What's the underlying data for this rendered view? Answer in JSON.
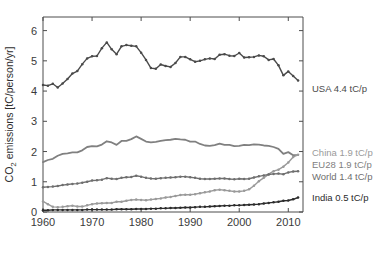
{
  "chart_data": {
    "type": "line",
    "title": "",
    "xlabel": "",
    "ylabel": "CO_2 emissions [tC/person/yr]",
    "ylabel_main": "CO",
    "ylabel_sub": "2",
    "ylabel_rest": " emissions [tC/person/yr]",
    "xlim": [
      1960,
      2013
    ],
    "ylim": [
      0,
      6.45
    ],
    "grid": false,
    "legend_position": "right-outside",
    "xticks": [
      1960,
      1970,
      1980,
      1990,
      2000,
      2010
    ],
    "xticklabels": [
      "1960",
      "1970",
      "1980",
      "1990",
      "2000",
      "2010"
    ],
    "yticks": [
      0,
      1,
      2,
      3,
      4,
      5,
      6
    ],
    "yticklabels": [
      "0",
      "1",
      "2",
      "3",
      "4",
      "5",
      "6"
    ],
    "x": [
      1960,
      1961,
      1962,
      1963,
      1964,
      1965,
      1966,
      1967,
      1968,
      1969,
      1970,
      1971,
      1972,
      1973,
      1974,
      1975,
      1976,
      1977,
      1978,
      1979,
      1980,
      1981,
      1982,
      1983,
      1984,
      1985,
      1986,
      1987,
      1988,
      1989,
      1990,
      1991,
      1992,
      1993,
      1994,
      1995,
      1996,
      1997,
      1998,
      1999,
      2000,
      2001,
      2002,
      2003,
      2004,
      2005,
      2006,
      2007,
      2008,
      2009,
      2010,
      2011,
      2012
    ],
    "series": [
      {
        "name": "USA",
        "label": "USA 4.4 tC/p",
        "color": "#4a4a4a",
        "end_value": 4.4,
        "marker": "dot",
        "values": [
          4.2,
          4.18,
          4.24,
          4.12,
          4.25,
          4.4,
          4.58,
          4.66,
          4.89,
          5.08,
          5.15,
          5.16,
          5.42,
          5.61,
          5.38,
          5.22,
          5.48,
          5.52,
          5.5,
          5.48,
          5.27,
          5.03,
          4.76,
          4.74,
          4.88,
          4.83,
          4.8,
          4.93,
          5.13,
          5.13,
          5.05,
          4.97,
          5.0,
          5.05,
          5.08,
          5.06,
          5.2,
          5.22,
          5.17,
          5.16,
          5.26,
          5.11,
          5.12,
          5.13,
          5.18,
          5.15,
          5.03,
          5.06,
          4.85,
          4.52,
          4.65,
          4.5,
          4.35
        ]
      },
      {
        "name": "EU28",
        "label": "EU28 1.9 tC/p",
        "color": "#808080",
        "end_value": 1.9,
        "marker": "line",
        "values": [
          1.65,
          1.72,
          1.76,
          1.86,
          1.92,
          1.94,
          1.97,
          1.97,
          2.04,
          2.15,
          2.18,
          2.17,
          2.23,
          2.34,
          2.3,
          2.22,
          2.35,
          2.35,
          2.41,
          2.5,
          2.42,
          2.33,
          2.3,
          2.32,
          2.35,
          2.38,
          2.39,
          2.42,
          2.4,
          2.39,
          2.33,
          2.33,
          2.25,
          2.2,
          2.19,
          2.21,
          2.26,
          2.22,
          2.22,
          2.18,
          2.19,
          2.22,
          2.21,
          2.24,
          2.23,
          2.2,
          2.19,
          2.15,
          2.09,
          1.92,
          1.98,
          1.88,
          1.88
        ]
      },
      {
        "name": "China",
        "label": "China 1.9 tC/p",
        "color": "#9a9a9a",
        "end_value": 1.9,
        "marker": "dot",
        "values": [
          0.35,
          0.26,
          0.17,
          0.16,
          0.17,
          0.19,
          0.21,
          0.18,
          0.18,
          0.22,
          0.26,
          0.28,
          0.29,
          0.3,
          0.3,
          0.34,
          0.34,
          0.37,
          0.4,
          0.41,
          0.4,
          0.39,
          0.41,
          0.43,
          0.45,
          0.48,
          0.5,
          0.53,
          0.56,
          0.57,
          0.57,
          0.59,
          0.62,
          0.65,
          0.68,
          0.72,
          0.74,
          0.72,
          0.7,
          0.68,
          0.68,
          0.7,
          0.75,
          0.87,
          1.02,
          1.13,
          1.25,
          1.35,
          1.4,
          1.5,
          1.64,
          1.82,
          1.89
        ]
      },
      {
        "name": "World",
        "label": "World 1.4 tC/p",
        "color": "#6e6e6e",
        "end_value": 1.4,
        "marker": "dot",
        "values": [
          0.82,
          0.83,
          0.84,
          0.86,
          0.89,
          0.91,
          0.93,
          0.94,
          0.97,
          1.0,
          1.04,
          1.05,
          1.07,
          1.12,
          1.1,
          1.09,
          1.13,
          1.15,
          1.16,
          1.2,
          1.17,
          1.13,
          1.11,
          1.1,
          1.12,
          1.13,
          1.14,
          1.15,
          1.17,
          1.17,
          1.15,
          1.13,
          1.1,
          1.09,
          1.09,
          1.1,
          1.11,
          1.11,
          1.09,
          1.08,
          1.1,
          1.09,
          1.1,
          1.14,
          1.18,
          1.21,
          1.24,
          1.26,
          1.27,
          1.25,
          1.31,
          1.34,
          1.35
        ]
      },
      {
        "name": "India",
        "label": "India 0.5 tC/p",
        "color": "#2b2b2b",
        "end_value": 0.5,
        "marker": "dot",
        "values": [
          0.06,
          0.06,
          0.07,
          0.07,
          0.07,
          0.07,
          0.07,
          0.07,
          0.07,
          0.08,
          0.08,
          0.08,
          0.08,
          0.08,
          0.08,
          0.09,
          0.09,
          0.09,
          0.09,
          0.1,
          0.1,
          0.1,
          0.11,
          0.11,
          0.12,
          0.12,
          0.13,
          0.13,
          0.14,
          0.15,
          0.15,
          0.16,
          0.17,
          0.17,
          0.18,
          0.19,
          0.2,
          0.21,
          0.21,
          0.22,
          0.22,
          0.23,
          0.24,
          0.25,
          0.26,
          0.28,
          0.3,
          0.32,
          0.34,
          0.37,
          0.38,
          0.42,
          0.48
        ]
      }
    ]
  }
}
